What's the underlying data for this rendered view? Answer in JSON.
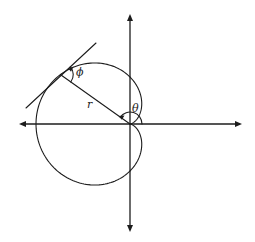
{
  "diagram": {
    "title": "",
    "curve": {
      "type": "cardioid",
      "equation_form": "r = a(1 - cos θ)",
      "a_px": 47,
      "cusp": [
        130,
        124
      ]
    },
    "axes": {
      "horizontal": {
        "y": 124,
        "x_from": 19,
        "x_to": 242,
        "arrows": "both"
      },
      "vertical": {
        "x": 130,
        "y_from": 14,
        "y_to": 232,
        "arrows": "both"
      }
    },
    "labels": {
      "phi": "ϕ",
      "r": "r",
      "theta": "θ"
    },
    "colors": {
      "line": "#1c1c1c",
      "background": "#ffffff"
    }
  }
}
